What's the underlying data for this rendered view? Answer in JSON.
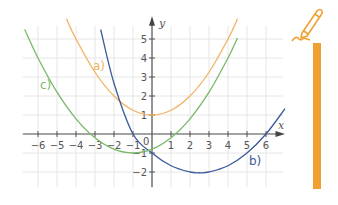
{
  "chart_data": {
    "type": "line",
    "title": "",
    "xlabel": "x",
    "ylabel": "y",
    "xlim": [
      -7,
      7
    ],
    "ylim": [
      -2.8,
      5.8
    ],
    "grid": true,
    "x_ticks": [
      -6,
      -5,
      -4,
      -3,
      -2,
      -1,
      1,
      2,
      3,
      4,
      5,
      6
    ],
    "y_ticks": [
      -2,
      -1,
      1,
      2,
      3,
      4,
      5
    ],
    "origin_label": "0",
    "series": [
      {
        "name": "a)",
        "label": "a)",
        "color": "#f2b262",
        "formula": "0.25*x^2+1",
        "x": [
          -4.5,
          -4,
          -3,
          -2,
          -1,
          0,
          1,
          2,
          3,
          4,
          4.5
        ],
        "values": [
          6.06,
          5,
          3.25,
          2,
          1.25,
          1,
          1.25,
          2,
          3.25,
          5,
          6.06
        ]
      },
      {
        "name": "b)",
        "label": "b)",
        "color": "#3a5a9a",
        "formula": "(x+1)(x-6)/6",
        "x": [
          -2.7,
          -2,
          -1,
          0,
          1,
          2,
          2.5,
          3,
          4,
          5,
          6,
          7
        ],
        "values": [
          5.5,
          2.67,
          0,
          -1,
          -1.67,
          -2,
          -2.04,
          -2,
          -1.67,
          -1,
          0,
          1.33
        ]
      },
      {
        "name": "c)",
        "label": "c)",
        "color": "#7ab86a",
        "formula": "0.2*(x+1)^2-1",
        "x": [
          -6.7,
          -6,
          -5,
          -4,
          -3,
          -2,
          -1,
          0,
          1,
          2,
          3,
          4,
          4.5
        ],
        "values": [
          5.5,
          4,
          2.2,
          0.8,
          -0.2,
          -0.8,
          -1,
          -0.8,
          -0.2,
          0.8,
          2.2,
          4,
          5.05
        ]
      }
    ]
  },
  "labels": {
    "a": "a)",
    "b": "b)",
    "c": "c)",
    "x_axis": "x",
    "y_axis": "y",
    "origin": "0"
  },
  "decor": {
    "pencil_color": "#f0a030"
  }
}
